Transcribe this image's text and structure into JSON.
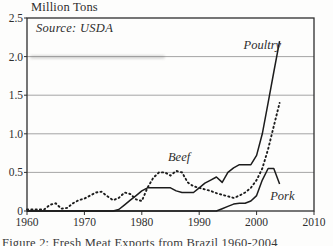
{
  "chart": {
    "title": "Million Tons",
    "source_note": "Source: USDA",
    "caption": "Figure 2: Fresh Meat Exports from Brazil 1960-2004"
  },
  "chart_data": {
    "type": "line",
    "title": "Million Tons",
    "source": "Source: USDA",
    "xlim": [
      1960,
      2010
    ],
    "ylim": [
      0,
      2.5
    ],
    "xticks": [
      1960,
      1970,
      1980,
      1990,
      2000,
      2010
    ],
    "yticks": [
      0,
      0.5,
      1.0,
      1.5,
      2.0,
      2.5
    ],
    "ytick_labels": [
      "0",
      "0.5",
      "1.0",
      "1.5",
      "2.0",
      "2.5"
    ],
    "grid": true,
    "legend": "inline-labels",
    "x": [
      1960,
      1961,
      1962,
      1963,
      1964,
      1965,
      1966,
      1967,
      1968,
      1969,
      1970,
      1971,
      1972,
      1973,
      1974,
      1975,
      1976,
      1977,
      1978,
      1979,
      1980,
      1981,
      1982,
      1983,
      1984,
      1985,
      1986,
      1987,
      1988,
      1989,
      1990,
      1991,
      1992,
      1993,
      1994,
      1995,
      1996,
      1997,
      1998,
      1999,
      2000,
      2001,
      2002,
      2003,
      2004
    ],
    "series": [
      {
        "name": "Poultry",
        "style": "solid",
        "values": [
          0,
          0,
          0,
          0,
          0,
          0,
          0,
          0,
          0,
          0,
          0,
          0,
          0,
          0,
          0,
          0,
          0.02,
          0.08,
          0.14,
          0.2,
          0.26,
          0.3,
          0.3,
          0.3,
          0.3,
          0.3,
          0.26,
          0.24,
          0.24,
          0.24,
          0.3,
          0.36,
          0.4,
          0.44,
          0.37,
          0.5,
          0.56,
          0.6,
          0.6,
          0.6,
          0.72,
          1.0,
          1.4,
          1.8,
          2.2
        ]
      },
      {
        "name": "Beef",
        "style": "dotted",
        "values": [
          0.02,
          0.02,
          0.02,
          0.02,
          0.08,
          0.1,
          0.03,
          0.04,
          0.1,
          0.14,
          0.16,
          0.2,
          0.24,
          0.25,
          0.19,
          0.14,
          0.17,
          0.24,
          0.22,
          0.15,
          0.13,
          0.3,
          0.43,
          0.5,
          0.5,
          0.46,
          0.52,
          0.5,
          0.37,
          0.32,
          0.3,
          0.28,
          0.26,
          0.23,
          0.21,
          0.19,
          0.17,
          0.2,
          0.24,
          0.3,
          0.4,
          0.55,
          0.8,
          1.1,
          1.4
        ]
      },
      {
        "name": "Pork",
        "style": "solid",
        "values": [
          0,
          0,
          0,
          0,
          0,
          0,
          0,
          0,
          0,
          0,
          0,
          0,
          0,
          0,
          0,
          0,
          0,
          0,
          0,
          0,
          0,
          0,
          0,
          0,
          0,
          0,
          0,
          0,
          0,
          0,
          0,
          0,
          0,
          0,
          0.03,
          0.06,
          0.09,
          0.1,
          0.1,
          0.13,
          0.2,
          0.4,
          0.55,
          0.55,
          0.35
        ]
      }
    ],
    "annotations": [
      {
        "label": "Poultry",
        "year": 2001.0,
        "value": 2.15
      },
      {
        "label": "Beef",
        "year": 1986.5,
        "value": 0.7
      },
      {
        "label": "Pork",
        "year": 2004.5,
        "value": 0.19
      }
    ],
    "colors": {
      "line": "#1c1c1c",
      "grid": "#9b9b9b",
      "box": "#2f2f2f",
      "text": "#2e2e2e"
    }
  }
}
